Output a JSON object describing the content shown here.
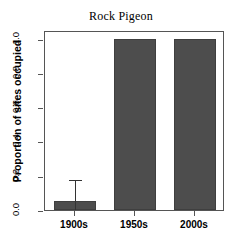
{
  "chart_data": {
    "type": "bar",
    "title": "Rock Pigeon",
    "xlabel": "",
    "ylabel": "Proportion of sites occupied",
    "categories": [
      "1900s",
      "1950s",
      "2000s"
    ],
    "values": [
      0.055,
      1.0,
      1.0
    ],
    "errors_upper": [
      0.17,
      null,
      null
    ],
    "errors_lower": [
      null,
      null,
      null
    ],
    "ylim": [
      0.0,
      1.05
    ],
    "yticks": [
      "0.0",
      "0.2",
      "0.4",
      "0.6",
      "0.8",
      "1.0"
    ],
    "ytick_values": [
      0.0,
      0.2,
      0.4,
      0.6,
      0.8,
      1.0
    ],
    "grid": false,
    "legend": false,
    "bar_color": "#4d4d4d",
    "axis_color": "#555555",
    "background": "#ffffff"
  },
  "axis": {
    "y_title": "Proportion of sites occupied"
  }
}
